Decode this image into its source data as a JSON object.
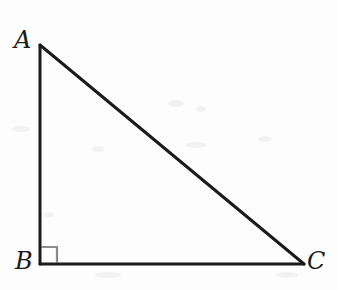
{
  "figure": {
    "kind": "geometry-diagram",
    "background_color": "#fdfdfd",
    "stroke_color": "#1b1b1b",
    "stroke_width": 3,
    "right_angle_marker_color": "#8c8c8c",
    "label_color": "#1b1b1b",
    "canvas": {
      "width": 337,
      "height": 290
    }
  },
  "vertices": [
    {
      "name": "A",
      "label": "A",
      "x": 40,
      "y": 45,
      "label_x": 14,
      "label_y": 28
    },
    {
      "name": "B",
      "label": "B",
      "x": 40,
      "y": 264,
      "label_x": 15,
      "label_y": 249
    },
    {
      "name": "C",
      "label": "C",
      "x": 304,
      "y": 264,
      "label_x": 307,
      "label_y": 249
    }
  ],
  "edges": [
    {
      "name": "AB",
      "from": "A",
      "to": "B",
      "role": "vertical-leg"
    },
    {
      "name": "BC",
      "from": "B",
      "to": "C",
      "role": "horizontal-leg"
    },
    {
      "name": "CA",
      "from": "C",
      "to": "A",
      "role": "hypotenuse"
    }
  ],
  "right_angle": {
    "at_vertex": "B",
    "marker": "square",
    "size": 17
  },
  "chart_data": {
    "type": "scatter",
    "title": "",
    "xlabel": "",
    "ylabel": "",
    "xlim": [
      0,
      337
    ],
    "ylim": [
      0,
      290
    ],
    "grid": false,
    "legend": "none",
    "series": [
      {
        "name": "triangle-ABC",
        "x": [
          40,
          40,
          304,
          40
        ],
        "y": [
          45,
          264,
          264,
          45
        ],
        "labels": [
          "A",
          "B",
          "C",
          "A"
        ]
      }
    ],
    "annotations": [
      {
        "text": "A",
        "x": 40,
        "y": 45
      },
      {
        "text": "B",
        "x": 40,
        "y": 264
      },
      {
        "text": "C",
        "x": 304,
        "y": 264
      },
      {
        "text": "right angle at B",
        "x": 49,
        "y": 255
      }
    ]
  }
}
